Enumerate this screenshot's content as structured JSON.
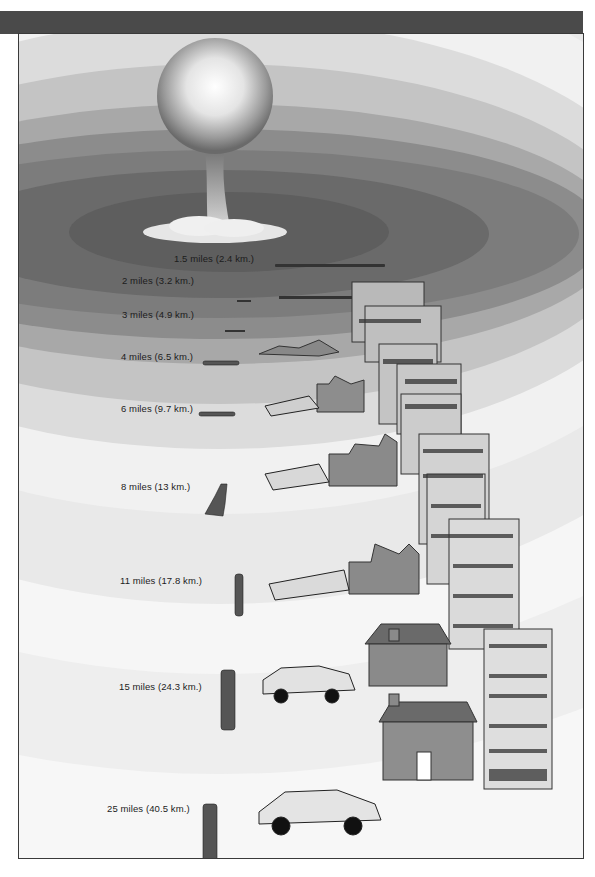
{
  "diagram": {
    "type": "blast-radius-illustration",
    "center_icon": "mushroom-cloud",
    "colors": {
      "header_bar": "#4a4a4a",
      "frame_border": "#3a3a3a",
      "zone_innermost": "#5e5e5e",
      "zone_outermost": "#f2f2f2"
    }
  },
  "zones": [
    {
      "label": "1.5 miles (2.4 km.)",
      "damage": "debris only"
    },
    {
      "label": "2 miles (3.2 km.)",
      "damage": "collapsed building ruins"
    },
    {
      "label": "3 miles (4.9 km.)",
      "damage": "person flattened, high-rise gutted"
    },
    {
      "label": "4 miles (6.5 km.)",
      "damage": "person lying, car crushed, walls remaining"
    },
    {
      "label": "6 miles (9.7 km.)",
      "damage": "person lying, car wrecked, house shell"
    },
    {
      "label": "8 miles (13 km.)",
      "damage": "person kneeling, car overturned, house roofless"
    },
    {
      "label": "11 miles (17.8 km.)",
      "damage": "person standing burned, car overturned, roof destroyed"
    },
    {
      "label": "15 miles (24.3 km.)",
      "damage": "person standing, car intact, house roof damaged and burning"
    },
    {
      "label": "25 miles (40.5 km.)",
      "damage": "person standing, car intact, house intact with small fires"
    }
  ]
}
